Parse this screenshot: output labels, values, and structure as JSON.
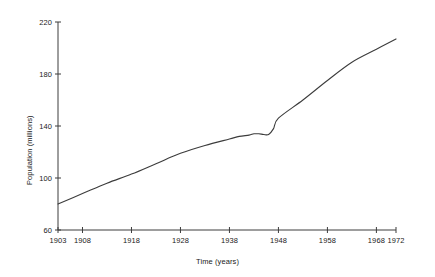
{
  "chart_data": {
    "type": "line",
    "title": "",
    "xlabel": "Time (years)",
    "ylabel": "Population (millions)",
    "xlim": [
      1903,
      1972
    ],
    "ylim": [
      60,
      220
    ],
    "grid": false,
    "legend": null,
    "xticks": [
      1903,
      1908,
      1918,
      1928,
      1938,
      1948,
      1958,
      1968,
      1972
    ],
    "xtick_labels": [
      "1903",
      "1908",
      "1918",
      "1928",
      "1938",
      "1948",
      "1958",
      "1968",
      "1972"
    ],
    "yticks": [
      60,
      100,
      140,
      180,
      220
    ],
    "ytick_labels": [
      "60",
      "100",
      "140",
      "180",
      "220"
    ],
    "line_color": "#3c3c3c",
    "line_width": 1.1,
    "series": [
      {
        "name": "Population",
        "x": [
          1903,
          1908,
          1913,
          1918,
          1923,
          1928,
          1933,
          1938,
          1940,
          1942,
          1943,
          1944,
          1945,
          1946,
          1947,
          1948,
          1953,
          1958,
          1963,
          1968,
          1972
        ],
        "values": [
          80,
          88,
          96,
          103,
          111,
          119,
          125,
          130,
          132,
          133,
          134,
          134,
          133.5,
          133.5,
          138,
          146,
          160,
          175,
          189,
          199,
          207
        ]
      }
    ],
    "annotations": []
  },
  "axes": {
    "y_title": "Population (millions)",
    "x_title": "Time (years)"
  }
}
